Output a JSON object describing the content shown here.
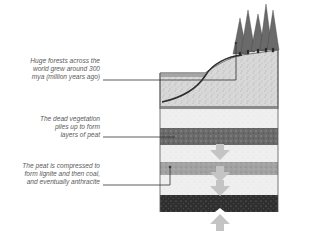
{
  "diagram": {
    "labels": [
      {
        "id": "forests",
        "lines": [
          "Huge forests across the",
          "world grew around 300",
          "mya (million years ago)"
        ]
      },
      {
        "id": "peat",
        "lines": [
          "The dead vegetation",
          "piles up to form",
          "layers of peat"
        ]
      },
      {
        "id": "compression",
        "lines": [
          "The peat is compressed to",
          "form lignite and then coal,",
          "and eventually anthracite"
        ]
      }
    ],
    "layers": [
      {
        "name": "forest-soil",
        "shade": "light"
      },
      {
        "name": "peat",
        "shade": "dark"
      },
      {
        "name": "lignite",
        "shade": "medium"
      },
      {
        "name": "coal",
        "shade": "darkest"
      }
    ],
    "colors": {
      "text": "#5a5a5a",
      "leader_line": "#333333",
      "soil": "#cfcfcf",
      "peat": "#6e6e6e",
      "lignite": "#9a9a9a",
      "coal": "#2e2e2e",
      "arrow": "#c4c4c4",
      "tree": "#555555"
    }
  }
}
